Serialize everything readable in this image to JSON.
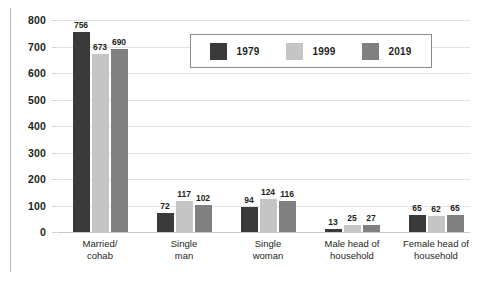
{
  "chart_data": {
    "type": "bar",
    "title": "",
    "subtitle": "",
    "xlabel": "",
    "ylabel": "",
    "ylim": [
      0,
      800
    ],
    "ytick_step": 100,
    "yticks": [
      "800",
      "700",
      "600",
      "500",
      "400",
      "300",
      "200",
      "100",
      "0"
    ],
    "grid": true,
    "legend_position": "top-right-inside",
    "categories": [
      "Married/\ncohab",
      "Single\nman",
      "Single\nwoman",
      "Male head of\nhousehold",
      "Female head of\nhousehold"
    ],
    "series": [
      {
        "name": "1979",
        "color": "#3a3a3a",
        "values": [
          756,
          72,
          94,
          13,
          65
        ]
      },
      {
        "name": "1999",
        "color": "#c5c5c5",
        "values": [
          673,
          117,
          124,
          25,
          62
        ]
      },
      {
        "name": "2019",
        "color": "#808080",
        "values": [
          690,
          102,
          116,
          27,
          65
        ]
      }
    ],
    "data_labels": [
      [
        "756",
        "673",
        "690"
      ],
      [
        "72",
        "117",
        "102"
      ],
      [
        "94",
        "124",
        "116"
      ],
      [
        "13",
        "25",
        "27"
      ],
      [
        "65",
        "62",
        "65"
      ]
    ]
  },
  "colors": {
    "series_1979": "#3a3a3a",
    "series_1999": "#c5c5c5",
    "series_2019": "#808080",
    "gridline": "#e2e2e2",
    "baseline": "#c8c8c8",
    "text": "#231f20",
    "legend_border": "#8a8a8a",
    "background": "#ffffff"
  }
}
